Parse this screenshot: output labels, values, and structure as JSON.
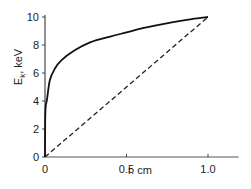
{
  "chart_data": {
    "type": "line",
    "title": "",
    "xlabel": "r. cm",
    "ylabel": {
      "main": "E",
      "sub": "k",
      "rest": ", keV"
    },
    "xlim": [
      0,
      1.2
    ],
    "ylim": [
      0,
      10
    ],
    "grid": false,
    "legend": "none",
    "x_ticks": [
      {
        "value": 0,
        "label": "0"
      },
      {
        "value": 0.5,
        "label": "0.5"
      },
      {
        "value": 1.0,
        "label": "1.0"
      }
    ],
    "y_ticks": [
      {
        "value": 0,
        "label": "0"
      },
      {
        "value": 2,
        "label": "2"
      },
      {
        "value": 4,
        "label": "4"
      },
      {
        "value": 6,
        "label": "6"
      },
      {
        "value": 8,
        "label": "8"
      },
      {
        "value": 10,
        "label": "10"
      }
    ],
    "series": [
      {
        "name": "solid-curve",
        "style": "solid",
        "color": "#111111",
        "x": [
          0,
          0.001,
          0.004,
          0.012,
          0.03,
          0.06,
          0.1,
          0.18,
          0.28,
          0.4,
          0.5,
          0.6,
          0.77,
          0.9,
          1.0
        ],
        "y": [
          0,
          2.5,
          3.6,
          4.1,
          5.5,
          6.3,
          6.9,
          7.6,
          8.2,
          8.6,
          8.9,
          9.2,
          9.6,
          9.85,
          10
        ]
      },
      {
        "name": "dashed-line",
        "style": "dashed",
        "color": "#222222",
        "x": [
          0,
          1.0
        ],
        "y": [
          0,
          10
        ]
      }
    ]
  }
}
